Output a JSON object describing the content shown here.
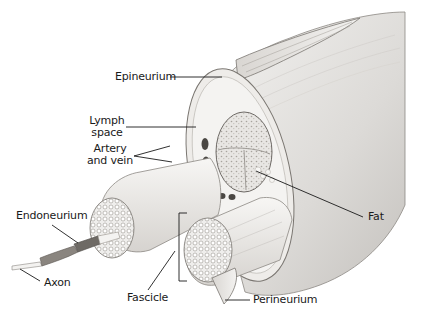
{
  "diagram": {
    "labels": {
      "epineurium": "Epineurium",
      "lymph_space_line1": "Lymph",
      "lymph_space_line2": "space",
      "artery_vein_line1": "Artery",
      "artery_vein_line2": "and vein",
      "endoneurium": "Endoneurium",
      "axon": "Axon",
      "fascicle": "Fascicle",
      "fat": "Fat",
      "perineurium": "Perineurium"
    },
    "colors": {
      "tissue_light": "#f2f1ef",
      "tissue_mid": "#dddbd8",
      "tissue_dark": "#b9b6b2",
      "outline": "#6e6a66",
      "leader_line": "#1a1a1a"
    }
  }
}
